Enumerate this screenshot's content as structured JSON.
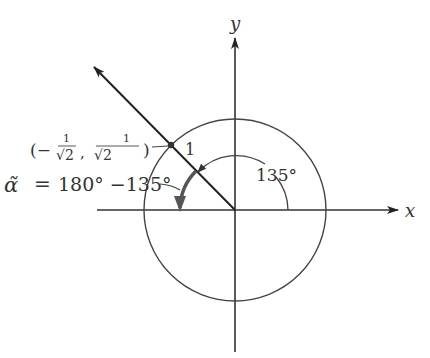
{
  "diagram": {
    "type": "unit-circle-reference-angle",
    "axes": {
      "x_label": "x",
      "y_label": "y"
    },
    "circle": {
      "radius_label": "1"
    },
    "point": {
      "label_prefix": "(−",
      "frac1_num": "1",
      "frac1_den": "√2",
      "sep": ",",
      "frac2_num": "1",
      "frac2_den": "√2",
      "label_suffix": ")"
    },
    "angle": {
      "label": "135°",
      "degrees": 135
    },
    "reference_angle": {
      "symbol": "α̃",
      "equals": "=",
      "expression": "180° −135°"
    },
    "colors": {
      "stroke": "#333333",
      "background": "#ffffff"
    }
  }
}
